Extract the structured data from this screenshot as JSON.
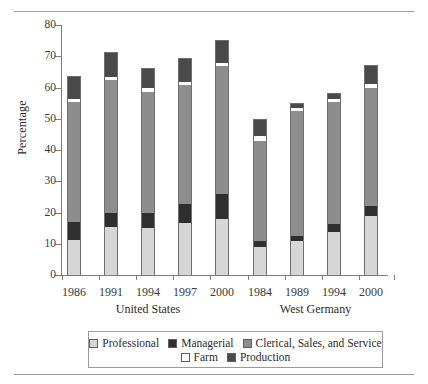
{
  "chart_data": {
    "type": "bar",
    "subtype": "stacked-bar-grouped",
    "title": "",
    "xlabel": "",
    "ylabel": "Percentage",
    "ylim": [
      0,
      80
    ],
    "yticks": [
      0,
      10,
      20,
      30,
      40,
      50,
      60,
      70,
      80
    ],
    "grid": false,
    "legend_position": "bottom",
    "groups": [
      "United States",
      "West Germany"
    ],
    "categories": [
      "1986",
      "1991",
      "1994",
      "1997",
      "2000",
      "1984",
      "1989",
      "1994",
      "2000"
    ],
    "category_groups": [
      "United States",
      "United States",
      "United States",
      "United States",
      "United States",
      "West Germany",
      "West Germany",
      "West Germany",
      "West Germany"
    ],
    "series": [
      {
        "name": "Professional",
        "color": "#d6d6d6",
        "values": [
          11.2,
          15.5,
          15.0,
          16.8,
          18.0,
          9.0,
          10.8,
          13.8,
          19.0
        ]
      },
      {
        "name": "Managerial",
        "color": "#2f2f2f",
        "values": [
          5.8,
          4.5,
          5.0,
          6.0,
          8.0,
          2.0,
          1.8,
          2.5,
          3.0
        ]
      },
      {
        "name": "Clerical, Sales, and Service",
        "color": "#8d8d8d",
        "values": [
          38.3,
          42.3,
          38.7,
          38.0,
          41.0,
          32.0,
          40.0,
          39.0,
          38.0
        ]
      },
      {
        "name": "Farm",
        "color": "#ffffff",
        "values": [
          1.0,
          1.0,
          1.0,
          1.0,
          1.0,
          1.5,
          1.0,
          1.0,
          1.0
        ]
      },
      {
        "name": "Production",
        "color": "#4a4a4a",
        "values": [
          7.0,
          7.7,
          6.3,
          7.2,
          7.0,
          5.0,
          1.0,
          1.5,
          6.0
        ]
      }
    ],
    "totals": [
      63.3,
      71.0,
      66.0,
      69.0,
      75.0,
      49.5,
      54.6,
      57.8,
      67.0
    ],
    "legend_entries": [
      "Professional",
      "Managerial",
      "Clerical, Sales, and Service",
      "Farm",
      "Production"
    ]
  },
  "legend": {
    "row1": [
      "Professional",
      "Managerial",
      "Clerical, Sales, and Service"
    ],
    "row2": [
      "Farm",
      "Production"
    ]
  },
  "axis": {
    "y_title": "Percentage",
    "y_tick_labels": [
      "80",
      "70",
      "60",
      "50",
      "40",
      "30",
      "20",
      "10",
      "0"
    ],
    "x_tick_labels": [
      "1986",
      "1991",
      "1994",
      "1997",
      "2000",
      "1984",
      "1989",
      "1994",
      "2000"
    ],
    "group_labels": [
      "United States",
      "West Germany"
    ]
  }
}
